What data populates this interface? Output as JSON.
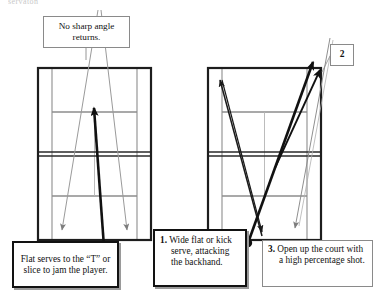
{
  "page": {
    "background_color": "#ffffff",
    "width": 378,
    "height": 299,
    "top_clipped_text": "servaton"
  },
  "callouts": [
    {
      "id": "no-sharp-angle",
      "text": "No sharp angle returns.",
      "style": "thin-border",
      "border_color": "#8a8a8a"
    },
    {
      "id": "flat-serves",
      "text": "Flat serves to the “T” or slice to jam the player.",
      "style": "thick-border-shadow",
      "border_color": "#121212"
    },
    {
      "id": "step-one",
      "number": "1.",
      "text": "Wide flat or kick serve, attacking the backhand.",
      "style": "thick-border-shadow",
      "border_color": "#121212"
    },
    {
      "id": "step-three",
      "number": "3.",
      "text": "Open up the court with a high percentage shot.",
      "style": "thin-border-shadow",
      "border_color": "#8a8a8a"
    },
    {
      "id": "step-two",
      "number": "2",
      "text": "2",
      "style": "thin-border",
      "border_color": "#8a8a8a"
    }
  ],
  "courts": [
    {
      "id": "left-court",
      "name": "serve-to-T-court",
      "serve_origin_label": "server position",
      "shots": [
        {
          "name": "serve-up-the-T",
          "weight": "thick",
          "color": "#111111"
        },
        {
          "name": "return-wide-left",
          "weight": "thin",
          "color": "#9a9a9a"
        },
        {
          "name": "return-wide-right",
          "weight": "thin",
          "color": "#9a9a9a"
        }
      ]
    },
    {
      "id": "right-court",
      "name": "wide-serve-court",
      "serve_origin_label": "server position",
      "shots": [
        {
          "name": "wide-serve-to-backhand",
          "weight": "thick",
          "color": "#111111"
        },
        {
          "name": "crosscourt-return",
          "weight": "medium",
          "color": "#1a1a1a"
        },
        {
          "name": "open-court-reply",
          "weight": "thin",
          "color": "#8f8f8f"
        }
      ]
    }
  ],
  "court_lines": {
    "outer_color": "#1d1d1d",
    "inner_color": "#8d8d8d",
    "net_color": "#2a2a2a"
  }
}
